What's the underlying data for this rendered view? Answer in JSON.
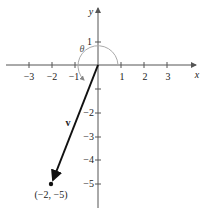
{
  "diagram": {
    "type": "vector-on-coordinate-plane",
    "axes": {
      "x_label": "x",
      "y_label": "y",
      "x_ticks": [
        "−3",
        "−2",
        "−1",
        "1",
        "2",
        "3"
      ],
      "y_ticks_positive": [
        "1"
      ],
      "y_ticks_negative": [
        "−2",
        "−3",
        "−4",
        "−5"
      ],
      "x_tick_values": [
        -3,
        -2,
        -1,
        1,
        2,
        3
      ],
      "y_tick_values": [
        1,
        -2,
        -3,
        -4,
        -5
      ]
    },
    "vector": {
      "label": "v",
      "from": [
        0,
        0
      ],
      "to": [
        -2,
        -5
      ],
      "endpoint_label": "(−2, −5)"
    },
    "angle": {
      "label": "θ",
      "description": "arc from positive x-axis counterclockwise to vector direction"
    },
    "colors": {
      "axis": "#555555",
      "vector": "#111111",
      "arc": "#aaaaaa"
    }
  }
}
